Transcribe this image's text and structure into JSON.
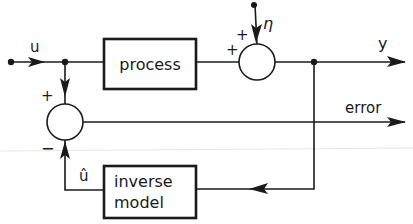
{
  "diagram": {
    "type": "block-diagram",
    "title": "",
    "blocks": [
      {
        "id": "process",
        "label": "process"
      },
      {
        "id": "inverse_model",
        "label_line1": "inverse",
        "label_line2": "model"
      }
    ],
    "summing_junctions": [
      {
        "id": "sum_output",
        "inputs": [
          {
            "from": "process",
            "sign": "+"
          },
          {
            "from": "eta",
            "sign": "+"
          }
        ]
      },
      {
        "id": "sum_error",
        "inputs": [
          {
            "from": "u",
            "sign": "+"
          },
          {
            "from": "u_hat",
            "sign": "−"
          }
        ]
      }
    ],
    "signals": {
      "input": "u",
      "noise": "η",
      "output": "y",
      "error": "error",
      "estimate": "û"
    },
    "signs": {
      "process_to_sum": "+",
      "noise_to_sum": "+",
      "u_to_error_sum": "+",
      "uhat_to_error_sum": "−"
    },
    "colors": {
      "ink": "#1a1a1a",
      "background": "#ffffff"
    }
  }
}
